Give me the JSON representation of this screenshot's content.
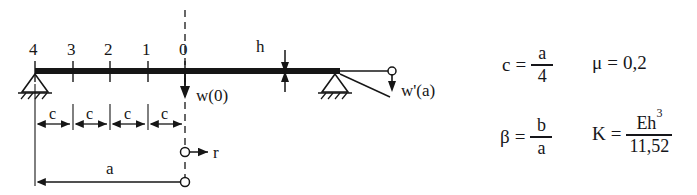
{
  "figure": {
    "type": "structural-beam-diagram",
    "background": "#ffffff",
    "ink_color": "#161616",
    "beam": {
      "label": "beam",
      "left_support_type": "pinned-hatched",
      "right_support_type": "pinned-hatched"
    },
    "node_labels": [
      "4",
      "3",
      "2",
      "1",
      "0"
    ],
    "annotations": {
      "deflection_center": "w(0)",
      "slope_end": "w'(a)",
      "thickness": "h",
      "radial_axis": "r",
      "segment_length": "c",
      "total_length": "a"
    },
    "segment_labels": [
      "c",
      "c",
      "c",
      "c"
    ]
  },
  "equations": [
    {
      "name": "segment-length",
      "lhs": "c",
      "eq": "=",
      "numerator": "a",
      "denominator": "4"
    },
    {
      "name": "poisson-ratio",
      "lhs": "μ",
      "eq": "=",
      "value": "0,2"
    },
    {
      "name": "beta-ratio",
      "lhs": "β",
      "eq": "=",
      "numerator": "b",
      "denominator": "a"
    },
    {
      "name": "plate-stiffness",
      "lhs": "K",
      "eq": "=",
      "numerator_base": "Eh",
      "numerator_exp": "3",
      "denominator": "11,52"
    }
  ]
}
